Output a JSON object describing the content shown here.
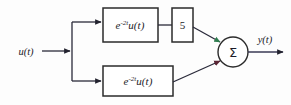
{
  "diagram": {
    "background_color": "#fdfdfd",
    "line_color": "#2a2a3a",
    "block_stroke_color": "#2b2b2b",
    "arrowhead_accent_color": "#2f7d4f",
    "input": {
      "label": "u(t)",
      "name": "input-signal"
    },
    "output": {
      "label": "y(t)",
      "name": "output-signal"
    },
    "blocks": [
      {
        "id": "top-impulse-response",
        "base": "e",
        "exponent": "-2t",
        "factor": "u(t)",
        "full_label": "e^-2t u(t)",
        "path": "top"
      },
      {
        "id": "gain-block",
        "label": "5",
        "path": "top"
      },
      {
        "id": "bottom-impulse-response",
        "base": "e",
        "exponent": "-2t",
        "factor": "u(t)",
        "full_label": "e^-2t u(t)",
        "path": "bottom"
      }
    ],
    "summing_junction": {
      "symbol": "Σ",
      "name": "summing-junction"
    },
    "branch_point": {
      "name": "branch-node"
    }
  }
}
